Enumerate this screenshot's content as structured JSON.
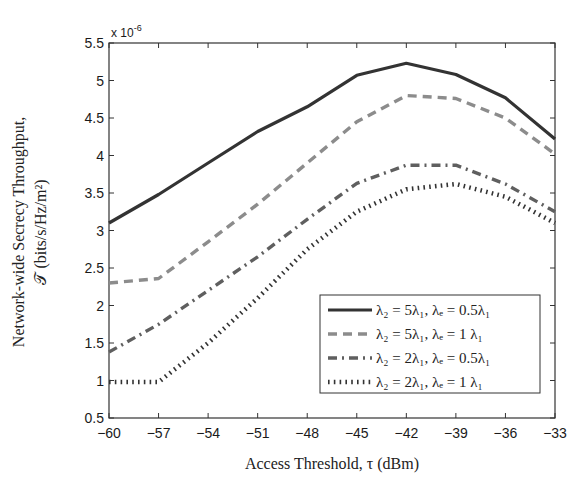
{
  "chart_data": {
    "type": "line",
    "title": "",
    "xlabel": "Access Threshold, τ (dBm)",
    "ylabel_line1": "Network-wide Secrecy Throughput,",
    "ylabel_line2": "𝒯 (bits/s/Hz/m²)",
    "y_multiplier": "x 10",
    "y_exponent": "-6",
    "x": [
      -60,
      -57,
      -54,
      -51,
      -48,
      -45,
      -42,
      -39,
      -36,
      -33
    ],
    "xticks": [
      "−60",
      "−57",
      "−54",
      "−51",
      "−48",
      "−45",
      "−42",
      "−39",
      "−36",
      "−33"
    ],
    "yticks": [
      "0.5",
      "1",
      "1.5",
      "2",
      "2.5",
      "3",
      "3.5",
      "4",
      "4.5",
      "5",
      "5.5"
    ],
    "xlim": [
      -60,
      -33
    ],
    "ylim": [
      0.5,
      5.5
    ],
    "grid": false,
    "legend_position": "lower right",
    "series": [
      {
        "name": "λ₂ = 5λ₁, λₑ = 0.5λ₁",
        "style": "solid",
        "color": "#333333",
        "values": [
          3.1,
          3.48,
          3.9,
          4.32,
          4.65,
          5.07,
          5.23,
          5.08,
          4.77,
          4.22
        ]
      },
      {
        "name": "λ₂ = 5λ₁, λₑ = 1 λ₁",
        "style": "dashed",
        "color": "#8c8c8c",
        "values": [
          2.3,
          2.36,
          2.85,
          3.35,
          3.9,
          4.45,
          4.8,
          4.76,
          4.5,
          4.02
        ]
      },
      {
        "name": "λ₂ = 2λ₁, λₑ = 0.5λ₁",
        "style": "dashdot",
        "color": "#5f5f5f",
        "values": [
          1.38,
          1.75,
          2.2,
          2.65,
          3.15,
          3.63,
          3.87,
          3.87,
          3.62,
          3.25
        ]
      },
      {
        "name": "λ₂ = 2λ₁, λₑ = 1 λ₁",
        "style": "dotted",
        "color": "#333333",
        "values": [
          0.98,
          0.98,
          1.5,
          2.1,
          2.75,
          3.25,
          3.55,
          3.62,
          3.45,
          3.1
        ]
      }
    ]
  }
}
